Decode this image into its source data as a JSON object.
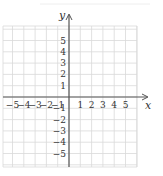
{
  "chart_data": {
    "type": "scatter",
    "title": "",
    "xlabel": "x",
    "ylabel": "y",
    "xlim": [
      -6,
      6
    ],
    "ylim": [
      -6,
      6
    ],
    "grid": true,
    "x_ticks": [
      -5,
      -4,
      -3,
      -2,
      -1,
      1,
      2,
      3,
      4,
      5
    ],
    "y_ticks": [
      5,
      4,
      3,
      2,
      1,
      -1,
      -2,
      -3,
      -4,
      -5
    ],
    "x_tick_labels": [
      "−5",
      "−4",
      "−3",
      "−2",
      "−1",
      "1",
      "2",
      "3",
      "4",
      "5"
    ],
    "y_tick_labels": [
      "5",
      "4",
      "3",
      "2",
      "1",
      "−1",
      "−2",
      "−3",
      "−4",
      "−5"
    ],
    "series": [],
    "colors": {
      "grid": "#d9d9d9",
      "axis": "#555555",
      "text": "#333333"
    }
  },
  "labels": {
    "x_axis": "x",
    "y_axis": "y"
  }
}
